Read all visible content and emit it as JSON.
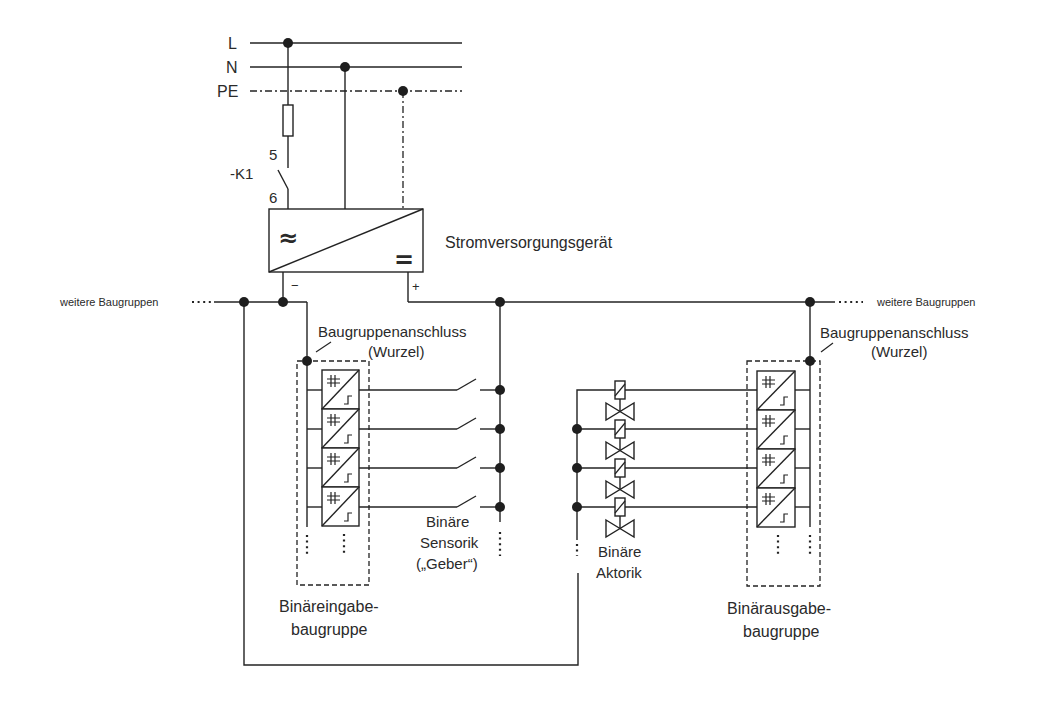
{
  "diagram": {
    "mains": {
      "line_label": "L",
      "neutral_label": "N",
      "protective_earth_label": "PE"
    },
    "contactor": {
      "label": "-K1",
      "terminal_top": "5",
      "terminal_bottom": "6"
    },
    "power_supply": {
      "label": "Stromversorgungsgerät",
      "ac_symbol": "≈",
      "dc_symbol": "=",
      "minus_label": "−",
      "plus_label": "+"
    },
    "bus": {
      "left_continuation": "weitere Baugruppen",
      "right_continuation": "weitere Baugruppen"
    },
    "input_module": {
      "root_label": "Baugruppenanschluss",
      "root_sublabel": "(Wurzel)",
      "title_line1": "Binäreingabe-",
      "title_line2": "baugruppe",
      "channel_count": 4
    },
    "sensors": {
      "line1": "Binäre",
      "line2": "Sensorik",
      "line3": "(„Geber“)"
    },
    "actuators": {
      "line1": "Binäre",
      "line2": "Aktorik"
    },
    "output_module": {
      "root_label": "Baugruppenanschluss",
      "root_sublabel": "(Wurzel)",
      "title_line1": "Binärausgabe-",
      "title_line2": "baugruppe",
      "channel_count": 4
    }
  }
}
